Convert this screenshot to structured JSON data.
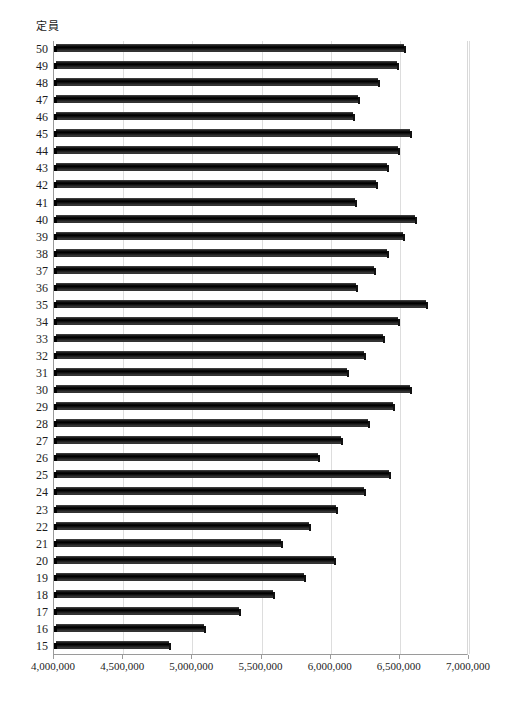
{
  "chart_data": {
    "type": "bar",
    "orientation": "horizontal",
    "title": "定員",
    "xlabel": "",
    "ylabel": "定員",
    "xlim": [
      4000000,
      7000000
    ],
    "xticks": [
      4000000,
      4500000,
      5000000,
      5500000,
      6000000,
      6500000,
      7000000
    ],
    "xtick_labels": [
      "4,000,000",
      "4,500,000",
      "5,000,000",
      "5,500,000",
      "6,000,000",
      "6,500,000",
      "7,000,000"
    ],
    "grid": true,
    "legend": false,
    "bar_color": "#000000",
    "categories": [
      "50",
      "49",
      "48",
      "47",
      "46",
      "45",
      "44",
      "43",
      "42",
      "41",
      "40",
      "39",
      "38",
      "37",
      "36",
      "35",
      "34",
      "33",
      "32",
      "31",
      "30",
      "29",
      "28",
      "27",
      "26",
      "25",
      "24",
      "23",
      "22",
      "21",
      "20",
      "19",
      "18",
      "17",
      "16",
      "15"
    ],
    "values": [
      6530000,
      6480000,
      6340000,
      6200000,
      6160000,
      6570000,
      6490000,
      6410000,
      6330000,
      6175000,
      6610000,
      6520000,
      6410000,
      6310000,
      6180000,
      6690000,
      6490000,
      6375000,
      6240000,
      6120000,
      6570000,
      6450000,
      6270000,
      6075000,
      5910000,
      6420000,
      6240000,
      6040000,
      5845000,
      5640000,
      6025000,
      5810000,
      5580000,
      5340000,
      5085000,
      4830000
    ]
  }
}
